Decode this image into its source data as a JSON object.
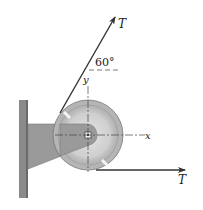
{
  "diagram": {
    "type": "pulley-free-body",
    "labels": {
      "tension_upper": "T",
      "tension_lower": "T",
      "angle": "60°",
      "axis_x": "x",
      "axis_y": "y"
    },
    "colors": {
      "wall": "#8a8a8a",
      "bracket": "#9a9a9a",
      "pulley_outer": "#b5b5b5",
      "pulley_inner": "#cfcfcf",
      "rope": "#333333"
    }
  }
}
